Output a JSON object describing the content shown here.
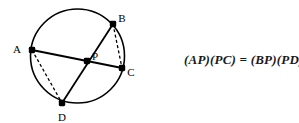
{
  "figure": {
    "background_color": "#ffffff",
    "stroke_color": "#000000",
    "equation": "(AP)(PC) = (BP)(PD)",
    "circle": {
      "center_x": 77.5,
      "center_y": 56,
      "radius": 47
    },
    "points": [
      {
        "id": "A",
        "label": "A",
        "x": 32,
        "y": 50,
        "label_x": 18,
        "label_y": 52
      },
      {
        "id": "B",
        "label": "B",
        "x": 113,
        "y": 24,
        "label_x": 119,
        "label_y": 24
      },
      {
        "id": "C",
        "label": "C",
        "x": 122,
        "y": 68,
        "label_x": 128,
        "label_y": 75
      },
      {
        "id": "D",
        "label": "D",
        "x": 62,
        "y": 103,
        "label_x": 58,
        "label_y": 120
      },
      {
        "id": "P",
        "label": "P",
        "x": 87,
        "y": 61,
        "label_x": 93,
        "label_y": 60
      }
    ],
    "solid_chords": [
      {
        "name": "chord-a-c",
        "from": "A",
        "to": "C"
      },
      {
        "name": "chord-b-d",
        "from": "B",
        "to": "D"
      }
    ],
    "dashed_chords": [
      {
        "name": "chord-a-d",
        "from": "A",
        "to": "D"
      },
      {
        "name": "chord-b-c",
        "from": "B",
        "to": "C"
      }
    ]
  }
}
